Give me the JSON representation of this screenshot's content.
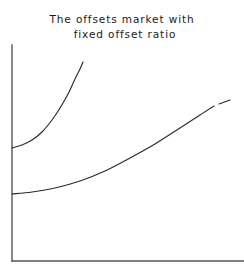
{
  "title": {
    "line_1": "The offsets market with",
    "line_2": "fixed offset ratio"
  },
  "chart_data": {
    "type": "line",
    "title": "The offsets market with fixed offset ratio",
    "subtitle": "",
    "xlabel": "",
    "ylabel": "",
    "grid": false,
    "legend_position": "none",
    "tick_labels": {
      "x": [],
      "y": []
    },
    "axes": {
      "style": "two-axis-corner",
      "y_axis": {
        "x": 12,
        "y_top": 45,
        "y_bottom": 261
      },
      "x_axis": {
        "y": 261,
        "x_left": 12,
        "x_right": 244
      },
      "color": "#555555"
    },
    "xlim": [
      0,
      244
    ],
    "ylim": [
      0,
      275
    ],
    "series": [
      {
        "name": "upper-curve",
        "shape": "convex-increasing",
        "color": "#2b2b2b",
        "start_point": [
          12,
          148
        ],
        "end_point": [
          83,
          62
        ],
        "points": [
          [
            12,
            148
          ],
          [
            22,
            145
          ],
          [
            32,
            140
          ],
          [
            42,
            132
          ],
          [
            52,
            120
          ],
          [
            60,
            108
          ],
          [
            68,
            94
          ],
          [
            75,
            79
          ],
          [
            80,
            69
          ],
          [
            83,
            62
          ]
        ]
      },
      {
        "name": "lower-curve",
        "shape": "gently-convex-increasing",
        "color": "#2b2b2b",
        "start_point": [
          12,
          194
        ],
        "end_point": [
          230,
          100
        ],
        "break_at_x": 216,
        "points": [
          [
            12,
            194
          ],
          [
            32,
            192
          ],
          [
            55,
            188
          ],
          [
            80,
            181
          ],
          [
            105,
            171
          ],
          [
            130,
            158
          ],
          [
            155,
            144
          ],
          [
            180,
            128
          ],
          [
            200,
            115
          ],
          [
            214,
            106
          ],
          [
            219,
            104
          ],
          [
            230,
            100
          ]
        ]
      }
    ]
  }
}
